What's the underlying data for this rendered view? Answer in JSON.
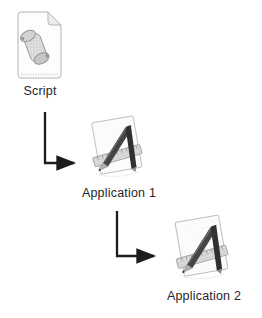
{
  "diagram": {
    "background_color": "#ffffff",
    "arrow_color": "#1c1c1c",
    "text_color": "#262626",
    "nodes": [
      {
        "id": "script",
        "label": "Script",
        "icon": "script-file-icon"
      },
      {
        "id": "app1",
        "label": "Application 1",
        "icon": "generic-application-icon"
      },
      {
        "id": "app2",
        "label": "Application 2",
        "icon": "generic-application-icon"
      }
    ],
    "connections": [
      {
        "from": "script",
        "to": "app1",
        "style": "elbow-down-right-arrow"
      },
      {
        "from": "app1",
        "to": "app2",
        "style": "elbow-down-right-arrow"
      }
    ]
  }
}
